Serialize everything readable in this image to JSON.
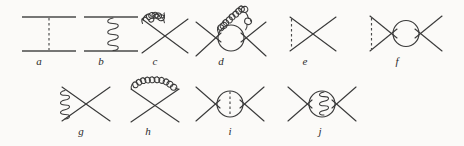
{
  "figure": {
    "background_color": "#fbfaf8",
    "line_color": "#3a3a3a",
    "type": "feynman-diagram-set",
    "rows": 2,
    "total_diagrams": 10
  },
  "diagrams": [
    {
      "id": "a",
      "label": "a",
      "row": 1,
      "position": 1,
      "topology": "two-parallel-horizontal-lines-with-vertical-dashed-exchange",
      "propagator": "dashed",
      "has_loop": false,
      "x": 18,
      "y": 12,
      "w": 62,
      "h": 44,
      "label_x": 39,
      "label_y": 56
    },
    {
      "id": "b",
      "label": "b",
      "row": 1,
      "position": 2,
      "topology": "two-parallel-horizontal-lines-with-vertical-gluon-exchange",
      "propagator": "gluon",
      "has_loop": false,
      "x": 80,
      "y": 12,
      "w": 62,
      "h": 44,
      "label_x": 101,
      "label_y": 56
    },
    {
      "id": "c",
      "label": "c",
      "row": 1,
      "position": 3,
      "topology": "x-vertex-with-gluon-arc-on-upper-left-leg",
      "propagator": "gluon",
      "has_loop": false,
      "x": 136,
      "y": 10,
      "w": 58,
      "h": 48,
      "label_x": 155,
      "label_y": 56
    },
    {
      "id": "d",
      "label": "d",
      "row": 1,
      "position": 4,
      "topology": "bubble-loop-with-gluon-arc-over-top",
      "propagator": "gluon",
      "has_loop": true,
      "x": 192,
      "y": 4,
      "w": 78,
      "h": 56,
      "label_x": 221,
      "label_y": 56
    },
    {
      "id": "e",
      "label": "e",
      "row": 1,
      "position": 5,
      "topology": "x-vertex-with-vertical-dashed-line-on-left-legs",
      "propagator": "dashed",
      "has_loop": false,
      "x": 284,
      "y": 12,
      "w": 58,
      "h": 44,
      "label_x": 305,
      "label_y": 56
    },
    {
      "id": "f",
      "label": "f",
      "row": 1,
      "position": 6,
      "topology": "bubble-loop-with-vertical-dashed-line-on-left-vertex",
      "propagator": "dashed",
      "has_loop": true,
      "x": 364,
      "y": 10,
      "w": 80,
      "h": 48,
      "label_x": 397,
      "label_y": 56
    },
    {
      "id": "g",
      "label": "g",
      "row": 2,
      "position": 1,
      "topology": "x-vertex-with-vertical-gluon-coil-on-left-legs",
      "propagator": "gluon",
      "has_loop": false,
      "x": 56,
      "y": 82,
      "w": 60,
      "h": 44,
      "label_x": 81,
      "label_y": 126
    },
    {
      "id": "h",
      "label": "h",
      "row": 2,
      "position": 2,
      "topology": "x-vertex-with-gluon-arc-over-both-upper-legs",
      "propagator": "gluon",
      "has_loop": false,
      "x": 124,
      "y": 78,
      "w": 60,
      "h": 48,
      "label_x": 148,
      "label_y": 126
    },
    {
      "id": "i",
      "label": "i",
      "row": 2,
      "position": 3,
      "topology": "bubble-loop-with-vertical-dashed-line-through-center",
      "propagator": "dashed",
      "has_loop": true,
      "x": 192,
      "y": 82,
      "w": 72,
      "h": 44,
      "label_x": 230,
      "label_y": 126
    },
    {
      "id": "j",
      "label": "j",
      "row": 2,
      "position": 4,
      "topology": "bubble-loop-with-vertical-gluon-coil-through-center",
      "propagator": "gluon",
      "has_loop": true,
      "x": 284,
      "y": 82,
      "w": 72,
      "h": 44,
      "label_x": 320,
      "label_y": 126
    }
  ]
}
